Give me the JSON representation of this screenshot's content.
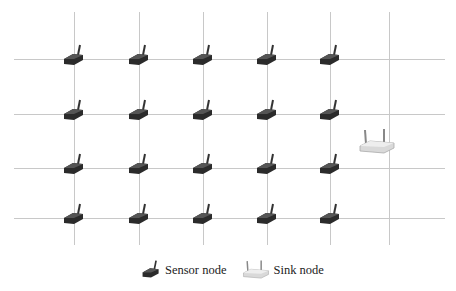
{
  "diagram": {
    "grid": {
      "horizontal_y": [
        59,
        114,
        168,
        218
      ],
      "vertical_x": [
        74,
        139,
        203,
        267,
        330,
        389
      ],
      "x_start": 14,
      "x_end": 445,
      "y_start": 12,
      "y_end": 245,
      "line_color": "#c8c8c8"
    },
    "sensor_nodes": {
      "columns_x": [
        74,
        139,
        203,
        267,
        330
      ],
      "rows_y": [
        59,
        114,
        168,
        218
      ],
      "count": 20,
      "color": "#2b2b2b"
    },
    "sink_node": {
      "x": 377,
      "y": 142,
      "color": "#d9d9d9"
    },
    "legend": {
      "sensor_label": "Sensor node",
      "sink_label": "Sink node"
    }
  }
}
